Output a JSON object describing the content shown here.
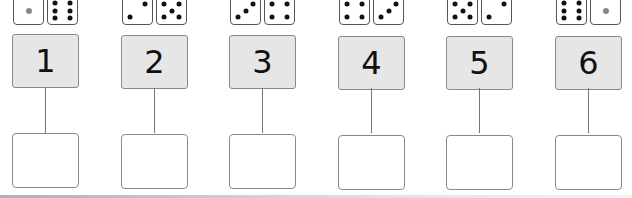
{
  "worksheet": {
    "columns": [
      {
        "number": "1",
        "dice": [
          1,
          6
        ],
        "answer": ""
      },
      {
        "number": "2",
        "dice": [
          2,
          5
        ],
        "answer": ""
      },
      {
        "number": "3",
        "dice": [
          3,
          4
        ],
        "answer": ""
      },
      {
        "number": "4",
        "dice": [
          4,
          3
        ],
        "answer": ""
      },
      {
        "number": "5",
        "dice": [
          5,
          2
        ],
        "answer": ""
      },
      {
        "number": "6",
        "dice": [
          6,
          1
        ],
        "answer": ""
      }
    ],
    "colors": {
      "number_box": "#e6e6e6",
      "border": "#8a8a8a",
      "pip": "#111111",
      "single_pip": "#888888"
    }
  }
}
